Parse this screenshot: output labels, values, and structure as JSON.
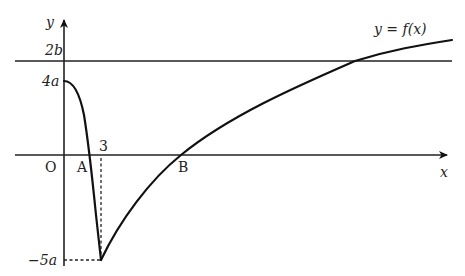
{
  "diagram": {
    "labels": {
      "y_axis": "y",
      "x_axis": "x",
      "origin": "O",
      "point_a": "A",
      "point_b": "B",
      "x_tick_3": "3",
      "y_tick_2b": "2b",
      "y_tick_4a": "4a",
      "y_tick_neg5a": "−5a",
      "curve_label": "y = f(x)"
    },
    "key_points": {
      "y_intercept": {
        "x": 0,
        "y": "4a"
      },
      "minimum": {
        "x": 3,
        "y": "-5a"
      },
      "root_a": {
        "label": "A"
      },
      "root_b": {
        "label": "B"
      },
      "horizontal_line": "y = 2b"
    },
    "colors": {
      "stroke": "#111111",
      "background": "#ffffff"
    }
  }
}
